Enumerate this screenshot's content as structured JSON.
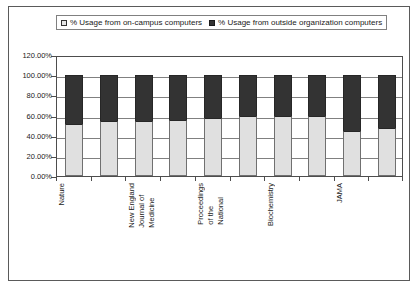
{
  "legend": {
    "entries": [
      {
        "label": "% Usage from on-campus computers",
        "swatch": "light-square-icon",
        "color": "#e0e0e0"
      },
      {
        "label": "% Usage from outside organization computers",
        "swatch": "dark-square-icon",
        "color": "#333333"
      }
    ]
  },
  "colors": {
    "on_campus": "#e0e0e0",
    "outside_org": "#333333",
    "frame": "#5a5a5a",
    "gridline": "#808080",
    "text": "#1a1a1a",
    "background": "#ffffff"
  },
  "chart_data": {
    "type": "bar",
    "stacked": true,
    "title": "",
    "subtitle": "",
    "xlabel": "",
    "ylabel": "",
    "ylim": [
      0,
      120
    ],
    "yticks": [
      "0.00%",
      "20.00%",
      "40.00%",
      "60.00%",
      "80.00%",
      "100.00%",
      "120.00%"
    ],
    "ytick_values": [
      0,
      20,
      40,
      60,
      80,
      100,
      120
    ],
    "grid": true,
    "legend_position": "top",
    "categories": [
      "Nature",
      "",
      "New England Journal of Medicine",
      "",
      "Proceedings of the National",
      "",
      "Biochemistry",
      "",
      "JAMA",
      ""
    ],
    "visible_tick_labels": [
      {
        "index": 0,
        "lines": [
          "Nature"
        ]
      },
      {
        "index": 2,
        "lines": [
          "New England",
          "Journal of",
          "Medicine"
        ]
      },
      {
        "index": 4,
        "lines": [
          "Proceedings",
          "of the",
          "National"
        ]
      },
      {
        "index": 6,
        "lines": [
          "Biochemistry"
        ]
      },
      {
        "index": 8,
        "lines": [
          "JAMA"
        ]
      }
    ],
    "series": [
      {
        "name": "% Usage from on-campus computers",
        "color": "#e0e0e0",
        "values": [
          52,
          55,
          55,
          56,
          58,
          60,
          60,
          60,
          45,
          48
        ]
      },
      {
        "name": "% Usage from outside organization computers",
        "color": "#333333",
        "values": [
          48,
          45,
          45,
          44,
          42,
          40,
          40,
          40,
          55,
          52
        ]
      }
    ],
    "totals": [
      100,
      100,
      100,
      100,
      100,
      100,
      100,
      100,
      100,
      100
    ]
  }
}
